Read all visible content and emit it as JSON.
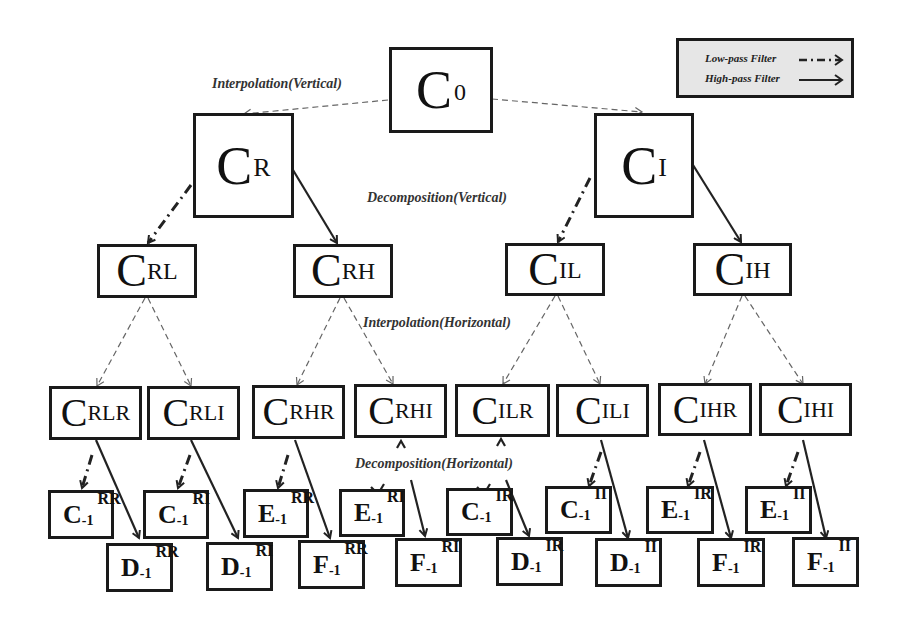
{
  "legend": {
    "low_pass": "Low-pass Filter",
    "high_pass": "High-pass Filter"
  },
  "labels": {
    "interp_vertical": "Interpolation(Vertical)",
    "decomp_vertical": "Decomposition(Vertical)",
    "interp_horizontal": "Interpolation(Horizontal)",
    "decomp_horizontal": "Decomposition(Horizontal)"
  },
  "nodes": {
    "root": {
      "base": "C",
      "sub": "0"
    },
    "level1": [
      {
        "base": "C",
        "sup": "R"
      },
      {
        "base": "C",
        "sup": "I"
      }
    ],
    "level2": [
      {
        "base": "C",
        "sup": "RL"
      },
      {
        "base": "C",
        "sup": "RH"
      },
      {
        "base": "C",
        "sup": "IL"
      },
      {
        "base": "C",
        "sup": "IH"
      }
    ],
    "level3": [
      {
        "base": "C",
        "sup": "RLR"
      },
      {
        "base": "C",
        "sup": "RLI"
      },
      {
        "base": "C",
        "sup": "RHR"
      },
      {
        "base": "C",
        "sup": "RHI"
      },
      {
        "base": "C",
        "sup": "ILR"
      },
      {
        "base": "C",
        "sup": "ILI"
      },
      {
        "base": "C",
        "sup": "IHR"
      },
      {
        "base": "C",
        "sup": "IHI"
      }
    ],
    "level4_low": [
      {
        "base": "C",
        "sub": "-1",
        "sup": "RR"
      },
      {
        "base": "C",
        "sub": "-1",
        "sup": "RI"
      },
      {
        "base": "E",
        "sub": "-1",
        "sup": "RR"
      },
      {
        "base": "E",
        "sub": "-1",
        "sup": "RI"
      },
      {
        "base": "C",
        "sub": "-1",
        "sup": "IR"
      },
      {
        "base": "C",
        "sub": "-1",
        "sup": "II"
      },
      {
        "base": "E",
        "sub": "-1",
        "sup": "IR"
      },
      {
        "base": "E",
        "sub": "-1",
        "sup": "II"
      }
    ],
    "level4_high": [
      {
        "base": "D",
        "sub": "-1",
        "sup": "RR"
      },
      {
        "base": "D",
        "sub": "-1",
        "sup": "RI"
      },
      {
        "base": "F",
        "sub": "-1",
        "sup": "RR"
      },
      {
        "base": "F",
        "sub": "-1",
        "sup": "RI"
      },
      {
        "base": "D",
        "sub": "-1",
        "sup": "IR"
      },
      {
        "base": "D",
        "sub": "-1",
        "sup": "II"
      },
      {
        "base": "F",
        "sub": "-1",
        "sup": "IR"
      },
      {
        "base": "F",
        "sub": "-1",
        "sup": "II"
      }
    ]
  }
}
